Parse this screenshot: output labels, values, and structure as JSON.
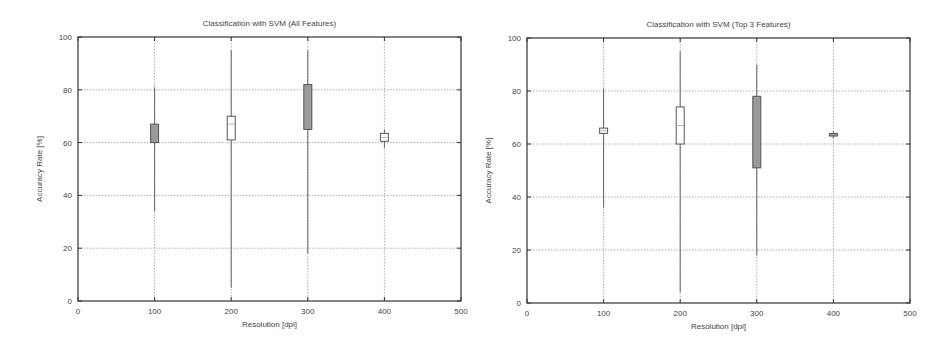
{
  "chart_data": [
    {
      "type": "candlestick",
      "title": "Classification with SVM (All Features)",
      "xlabel": "Resolution [dpi]",
      "ylabel": "Accuracy Rate [%]",
      "xlim": [
        0,
        500
      ],
      "ylim": [
        0,
        100
      ],
      "xticks": [
        0,
        100,
        200,
        300,
        400,
        500
      ],
      "yticks": [
        0,
        20,
        40,
        60,
        80,
        100
      ],
      "grid": true,
      "categories": [
        100,
        200,
        300,
        400
      ],
      "series": [
        {
          "x": 100,
          "whisker_low": 34,
          "box_low": 60,
          "median": 63,
          "box_high": 67,
          "whisker_high": 81,
          "fill": "shaded"
        },
        {
          "x": 200,
          "whisker_low": 5,
          "box_low": 61,
          "median": 67,
          "box_high": 70,
          "whisker_high": 95,
          "fill": "open"
        },
        {
          "x": 300,
          "whisker_low": 18,
          "box_low": 65,
          "median": 72,
          "box_high": 82,
          "whisker_high": 95,
          "fill": "shaded"
        },
        {
          "x": 400,
          "whisker_low": 58,
          "box_low": 60.5,
          "median": 62,
          "box_high": 63.5,
          "whisker_high": 65,
          "fill": "open"
        }
      ]
    },
    {
      "type": "candlestick",
      "title": "Classification with SVM (Top 3 Features)",
      "xlabel": "Resolution [dpi]",
      "ylabel": "Accuracy Rate [%]",
      "xlim": [
        0,
        500
      ],
      "ylim": [
        0,
        100
      ],
      "xticks": [
        0,
        100,
        200,
        300,
        400,
        500
      ],
      "yticks": [
        0,
        20,
        40,
        60,
        80,
        100
      ],
      "grid": true,
      "categories": [
        100,
        200,
        300,
        400
      ],
      "series": [
        {
          "x": 100,
          "whisker_low": 36,
          "box_low": 64,
          "median": 65,
          "box_high": 66,
          "whisker_high": 81,
          "fill": "open"
        },
        {
          "x": 200,
          "whisker_low": 4,
          "box_low": 60,
          "median": 67,
          "box_high": 74,
          "whisker_high": 95,
          "fill": "open"
        },
        {
          "x": 300,
          "whisker_low": 18,
          "box_low": 51,
          "median": 67,
          "box_high": 78,
          "whisker_high": 90,
          "fill": "shaded"
        },
        {
          "x": 400,
          "whisker_low": 62,
          "box_low": 63,
          "median": 63.5,
          "box_high": 64,
          "whisker_high": 65,
          "fill": "shaded"
        }
      ]
    }
  ],
  "colors": {
    "axis": "#333333",
    "grid": "#999999",
    "box_stroke": "#555555",
    "box_shaded": "#9a9a9a",
    "box_open": "#ffffff",
    "text": "#444444"
  }
}
